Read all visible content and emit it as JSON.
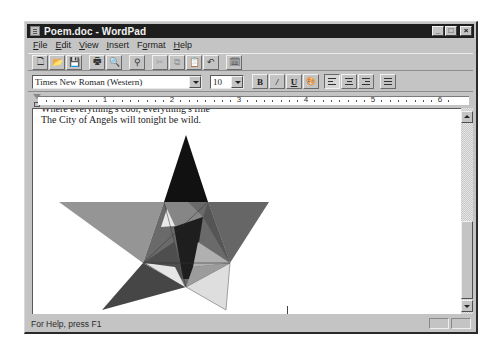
{
  "window": {
    "title": "Poem.doc - WordPad",
    "controls": {
      "minimize": "_",
      "maximize": "□",
      "close": "×"
    }
  },
  "menubar": {
    "items": [
      {
        "label": "File",
        "mnemonic": "F",
        "rest": "ile"
      },
      {
        "label": "Edit",
        "mnemonic": "E",
        "rest": "dit"
      },
      {
        "label": "View",
        "mnemonic": "V",
        "rest": "iew"
      },
      {
        "label": "Insert",
        "mnemonic": "I",
        "rest": "nsert"
      },
      {
        "label": "Format",
        "mnemonic": "o",
        "pre": "F",
        "rest": "rmat"
      },
      {
        "label": "Help",
        "mnemonic": "H",
        "rest": "elp"
      }
    ]
  },
  "toolbar": {
    "buttons": [
      {
        "name": "new",
        "icon": "new-document-icon",
        "glyph": "🗋"
      },
      {
        "name": "open",
        "icon": "open-folder-icon",
        "glyph": "📂"
      },
      {
        "name": "save",
        "icon": "save-disk-icon",
        "glyph": "💾"
      },
      {
        "name": "print",
        "icon": "print-icon",
        "glyph": "🖶"
      },
      {
        "name": "print-preview",
        "icon": "print-preview-icon",
        "glyph": "🔍"
      },
      {
        "name": "find",
        "icon": "binoculars-icon",
        "glyph": "⚲"
      },
      {
        "name": "cut",
        "icon": "scissors-icon",
        "glyph": "✂",
        "disabled": true
      },
      {
        "name": "copy",
        "icon": "copy-icon",
        "glyph": "⧉",
        "disabled": true
      },
      {
        "name": "paste",
        "icon": "paste-icon",
        "glyph": "📋"
      },
      {
        "name": "undo",
        "icon": "undo-icon",
        "glyph": "↶"
      },
      {
        "name": "insert-datetime",
        "icon": "date-time-icon",
        "glyph": "🗓"
      }
    ]
  },
  "formatbar": {
    "font": "Times New Roman (Western)",
    "size": "10",
    "bold": "B",
    "italic": "/",
    "underline": "U",
    "color": "🎨"
  },
  "ruler": {
    "numbers": [
      "1",
      "2",
      "3",
      "4",
      "5",
      "6"
    ]
  },
  "document": {
    "lines": [
      "Where everything's cool, everything's fine",
      "The City of Angels will tonight be wild."
    ],
    "drawing": {
      "type": "star",
      "points": {
        "top": [
          153,
          47
        ],
        "left": [
          50,
          115
        ],
        "right": [
          260,
          115
        ],
        "bottom_left": [
          93,
          222
        ],
        "bottom_right": [
          217,
          222
        ]
      },
      "fills": [
        "#111111",
        "#8f8f8f",
        "#5e5e5e",
        "#3c3c3c",
        "#dedede"
      ]
    }
  },
  "status": {
    "text": "For Help, press F1"
  }
}
